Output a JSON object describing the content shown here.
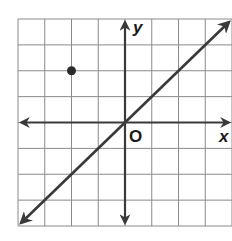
{
  "graph": {
    "x_label": "x",
    "y_label": "y",
    "origin_label": "O",
    "x_range": [
      -4,
      4
    ],
    "y_range": [
      -4,
      4
    ],
    "grid_step": 1,
    "colors": {
      "grid": "#8a8a8a",
      "axis": "#3a3a3a",
      "line": "#3a3a3a",
      "point": "#2a2a2a",
      "background": "#ffffff"
    },
    "point": {
      "x": -2,
      "y": 2
    },
    "line": {
      "equation": "y = x",
      "slope": 1,
      "intercept": 0,
      "from": [
        -4,
        -4
      ],
      "to": [
        4,
        4
      ]
    }
  }
}
